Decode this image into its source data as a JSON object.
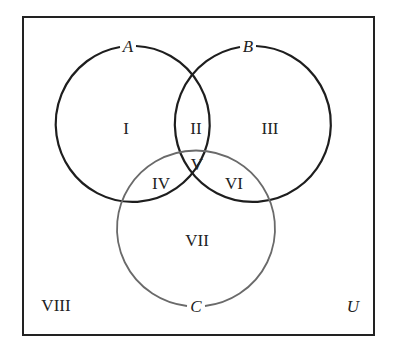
{
  "diagram": {
    "type": "venn",
    "universe_label": "U",
    "sets": [
      {
        "name": "A",
        "stroke": "#1e1e1e"
      },
      {
        "name": "B",
        "stroke": "#1e1e1e"
      },
      {
        "name": "C",
        "stroke": "#6a6a6a"
      }
    ],
    "regions": [
      {
        "id": "I",
        "label": "I",
        "description": "A only"
      },
      {
        "id": "II",
        "label": "II",
        "description": "A and B only"
      },
      {
        "id": "III",
        "label": "III",
        "description": "B only"
      },
      {
        "id": "IV",
        "label": "IV",
        "description": "A and C only"
      },
      {
        "id": "V",
        "label": "V",
        "description": "A, B and C"
      },
      {
        "id": "VI",
        "label": "VI",
        "description": "B and C only"
      },
      {
        "id": "VII",
        "label": "VII",
        "description": "C only"
      },
      {
        "id": "VIII",
        "label": "VIII",
        "description": "outside A, B, C"
      }
    ]
  }
}
